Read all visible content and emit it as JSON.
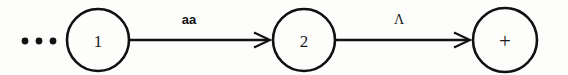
{
  "diagram": {
    "type": "finite-state-automaton-fragment",
    "background_color": "#fdfdfc",
    "ink_color": "#111111",
    "continuation": {
      "symbol": "•••",
      "meaning": "ellipsis-preceding-states"
    },
    "states": [
      {
        "id": "state-1",
        "label": "1",
        "accepting": false,
        "cx": 98,
        "cy": 40,
        "r": 31
      },
      {
        "id": "state-2",
        "label": "2",
        "accepting": false,
        "cx": 304,
        "cy": 40,
        "r": 31
      },
      {
        "id": "state-plus",
        "label": "+",
        "accepting": false,
        "cx": 505,
        "cy": 40,
        "r": 32
      }
    ],
    "transitions": [
      {
        "id": "transition-1-to-2",
        "from": "state-1",
        "to": "state-2",
        "label": "aa",
        "label_style": "bold-sans",
        "label_x": 189,
        "label_y": 24,
        "x1": 130,
        "x2": 272,
        "y": 40
      },
      {
        "id": "transition-2-to-plus",
        "from": "state-2",
        "to": "state-plus",
        "label": "Λ",
        "label_style": "serif-greek",
        "label_x": 399,
        "label_y": 24,
        "x1": 336,
        "x2": 472,
        "y": 40
      }
    ],
    "ellipsis_dots": [
      {
        "cx": 25,
        "cy": 41,
        "r": 3.4
      },
      {
        "cx": 39,
        "cy": 41,
        "r": 3.4
      },
      {
        "cx": 53,
        "cy": 41,
        "r": 3.4
      }
    ]
  }
}
